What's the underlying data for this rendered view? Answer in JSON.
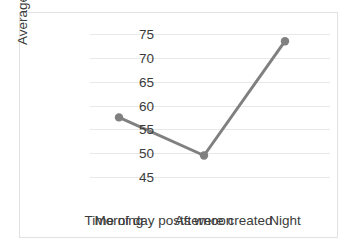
{
  "chart_data": {
    "type": "line",
    "title": "",
    "xlabel": "Time of day posts were created",
    "ylabel": "Average upvotes",
    "categories": [
      "Morning",
      "Afternoon",
      "Night"
    ],
    "values": [
      57.5,
      49.5,
      73.5
    ],
    "ylim": [
      45,
      75
    ],
    "yticks": [
      45,
      50,
      55,
      60,
      65,
      70,
      75
    ],
    "ytick_labels": [
      "45",
      "50",
      "55",
      "60",
      "65",
      "70",
      "75"
    ],
    "grid": "horizontal",
    "legend": "none",
    "series": [
      {
        "name": "Average upvotes",
        "values": [
          57.5,
          49.5,
          73.5
        ],
        "color": "#808080",
        "marker": "circle"
      }
    ],
    "colors": {
      "line": "#808080",
      "marker": "#808080",
      "gridline": "#e8e8e8",
      "text": "#3b3b3b",
      "frame_border": "#e2e2e2",
      "plot_background": "#ffffff"
    }
  }
}
